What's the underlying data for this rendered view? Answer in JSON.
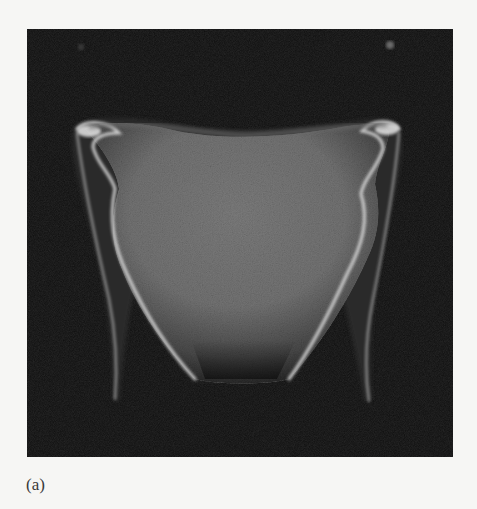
{
  "figure": {
    "panel_label": "(a)",
    "colors": {
      "page_background": "#f6f6f4",
      "image_background": "#0c0c0c",
      "tissue_gray": "#7a7a7a",
      "rim_highlight": "#e6e6e6",
      "label_text": "#3a3a3a"
    }
  }
}
